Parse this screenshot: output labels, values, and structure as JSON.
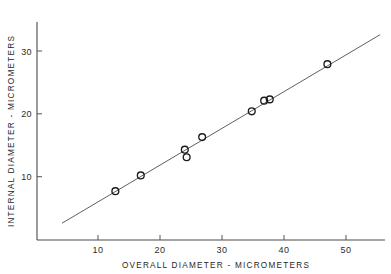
{
  "chart_data": {
    "type": "scatter",
    "title": "",
    "xlabel": "OVERALL DIAMETER - MICROMETERS",
    "ylabel": "INTERNAL DIAMETER - MICROMETERS",
    "xlim": [
      4,
      56
    ],
    "ylim": [
      2,
      33
    ],
    "xticks": [
      10,
      20,
      30,
      40,
      50
    ],
    "yticks": [
      10,
      20,
      30
    ],
    "xtick_labels": [
      "10",
      "20",
      "30",
      "40",
      "50"
    ],
    "ytick_labels": [
      "10",
      "20",
      "30"
    ],
    "grid": false,
    "legend": null,
    "marker": "open-circle",
    "x": [
      12.8,
      16.9,
      24.0,
      24.3,
      26.8,
      34.8,
      36.8,
      37.7,
      47.0
    ],
    "y": [
      7.7,
      10.2,
      14.3,
      13.1,
      16.3,
      20.4,
      22.1,
      22.3,
      27.9
    ],
    "points": [
      {
        "x": 12.8,
        "y": 7.7
      },
      {
        "x": 16.9,
        "y": 10.2
      },
      {
        "x": 24.0,
        "y": 14.3
      },
      {
        "x": 24.3,
        "y": 13.1
      },
      {
        "x": 26.8,
        "y": 16.3
      },
      {
        "x": 34.8,
        "y": 20.4
      },
      {
        "x": 36.8,
        "y": 22.1
      },
      {
        "x": 37.7,
        "y": 22.3
      },
      {
        "x": 47.0,
        "y": 27.9
      }
    ],
    "fit_line": {
      "type": "line",
      "x": [
        4.2,
        55.5
      ],
      "y": [
        2.6,
        32.6
      ],
      "slope": 0.585,
      "intercept": 0.14
    },
    "colors": {
      "axis": "#4a4a4a",
      "marker": "#1c1c1c",
      "line": "#4d4d4d",
      "text": "#1f1f1f",
      "background": "#ffffff"
    }
  },
  "axes": {
    "x_title": "OVERALL DIAMETER - MICROMETERS",
    "y_title": "INTERNAL DIAMETER - MICROMETERS"
  }
}
